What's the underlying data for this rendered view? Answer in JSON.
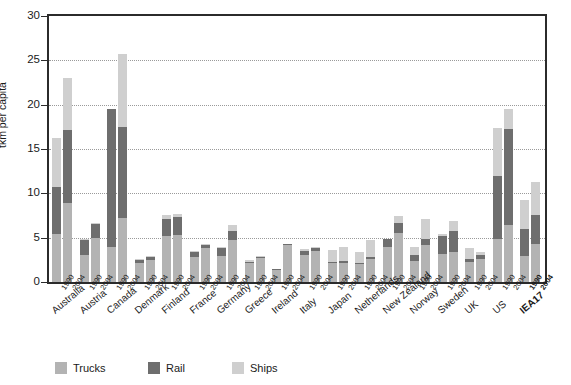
{
  "chart_data": {
    "type": "bar",
    "stacked": true,
    "title": "",
    "xlabel": "",
    "ylabel": "tkm per capita",
    "ylim": [
      0,
      30
    ],
    "ytick_step": 5,
    "yticks": [
      0,
      5,
      10,
      15,
      20,
      25,
      30
    ],
    "grid": "horizontal-dotted",
    "legend_position": "bottom",
    "series_order_bottom_to_top": [
      "Trucks",
      "Rail",
      "Ships"
    ],
    "legend": [
      {
        "name": "Trucks",
        "color": "#b3b3b3"
      },
      {
        "name": "Rail",
        "color": "#6e6e6e"
      },
      {
        "name": "Ships",
        "color": "#cfcfcf"
      }
    ],
    "categories": [
      "Australia",
      "Austria",
      "Canada",
      "Denmark",
      "Finland",
      "France",
      "Germany",
      "Greece",
      "Ireland",
      "Italy",
      "Japan",
      "Netherlands",
      "New Zealand",
      "Norway",
      "Sweden",
      "UK",
      "US",
      "IEA17"
    ],
    "years": [
      "1990",
      "2004"
    ],
    "highlight_category": "IEA17",
    "data": [
      {
        "country": "Australia",
        "year": "1990",
        "trucks": 5.4,
        "rail": 5.3,
        "ships": 5.6,
        "total": 16.3
      },
      {
        "country": "Australia",
        "year": "2004",
        "trucks": 8.9,
        "rail": 8.3,
        "ships": 5.8,
        "total": 23.0
      },
      {
        "country": "Austria",
        "year": "1990",
        "trucks": 3.1,
        "rail": 1.6,
        "ships": 0.1,
        "total": 4.8
      },
      {
        "country": "Austria",
        "year": "2004",
        "trucks": 5.0,
        "rail": 1.6,
        "ships": 0.1,
        "total": 6.7
      },
      {
        "country": "Canada",
        "year": "1990",
        "trucks": 3.9,
        "rail": 15.6,
        "ships": 0.0,
        "total": 19.5
      },
      {
        "country": "Canada",
        "year": "2004",
        "trucks": 7.2,
        "rail": 10.3,
        "ships": 8.2,
        "total": 25.7
      },
      {
        "country": "Denmark",
        "year": "1990",
        "trucks": 2.2,
        "rail": 0.3,
        "ships": 0.1,
        "total": 2.6
      },
      {
        "country": "Denmark",
        "year": "2004",
        "trucks": 2.5,
        "rail": 0.3,
        "ships": 0.1,
        "total": 2.9
      },
      {
        "country": "Finland",
        "year": "1990",
        "trucks": 5.2,
        "rail": 1.9,
        "ships": 0.5,
        "total": 7.6
      },
      {
        "country": "Finland",
        "year": "2004",
        "trucks": 5.3,
        "rail": 2.0,
        "ships": 0.4,
        "total": 7.7
      },
      {
        "country": "France",
        "year": "1990",
        "trucks": 2.8,
        "rail": 0.6,
        "ships": 0.1,
        "total": 3.5
      },
      {
        "country": "France",
        "year": "2004",
        "trucks": 3.8,
        "rail": 0.4,
        "ships": 0.1,
        "total": 4.3
      },
      {
        "country": "Germany",
        "year": "1990",
        "trucks": 2.9,
        "rail": 1.0,
        "ships": 0.1,
        "total": 4.0
      },
      {
        "country": "Germany",
        "year": "2004",
        "trucks": 4.7,
        "rail": 1.0,
        "ships": 0.7,
        "total": 6.4
      },
      {
        "country": "Greece",
        "year": "1990",
        "trucks": 2.1,
        "rail": 0.2,
        "ships": 0.2,
        "total": 2.5
      },
      {
        "country": "Greece",
        "year": "2004",
        "trucks": 2.7,
        "rail": 0.1,
        "ships": 0.1,
        "total": 2.9
      },
      {
        "country": "Ireland",
        "year": "1990",
        "trucks": 1.4,
        "rail": 0.1,
        "ships": 0.0,
        "total": 1.5
      },
      {
        "country": "Ireland",
        "year": "2004",
        "trucks": 4.2,
        "rail": 0.1,
        "ships": 0.0,
        "total": 4.3
      },
      {
        "country": "Italy",
        "year": "1990",
        "trucks": 3.1,
        "rail": 0.4,
        "ships": 0.2,
        "total": 3.7
      },
      {
        "country": "Italy",
        "year": "2004",
        "trucks": 3.5,
        "rail": 0.4,
        "ships": 0.1,
        "total": 4.0
      },
      {
        "country": "Japan",
        "year": "1990",
        "trucks": 2.1,
        "rail": 0.2,
        "ships": 1.3,
        "total": 3.6
      },
      {
        "country": "Japan",
        "year": "2004",
        "trucks": 2.2,
        "rail": 0.2,
        "ships": 1.5,
        "total": 3.9
      },
      {
        "country": "Netherlands",
        "year": "1990",
        "trucks": 2.0,
        "rail": 0.2,
        "ships": 1.2,
        "total": 3.4
      },
      {
        "country": "Netherlands",
        "year": "2004",
        "trucks": 2.6,
        "rail": 0.2,
        "ships": 1.9,
        "total": 4.7
      },
      {
        "country": "New Zealand",
        "year": "1990",
        "trucks": 3.9,
        "rail": 1.0,
        "ships": 0.0,
        "total": 4.9
      },
      {
        "country": "New Zealand",
        "year": "2004",
        "trucks": 5.5,
        "rail": 1.1,
        "ships": 0.9,
        "total": 7.5
      },
      {
        "country": "Norway",
        "year": "1990",
        "trucks": 2.4,
        "rail": 0.6,
        "ships": 1.0,
        "total": 4.0
      },
      {
        "country": "Norway",
        "year": "2004",
        "trucks": 4.2,
        "rail": 0.7,
        "ships": 2.2,
        "total": 7.1
      },
      {
        "country": "Sweden",
        "year": "1990",
        "trucks": 3.2,
        "rail": 2.0,
        "ships": 0.2,
        "total": 5.4
      },
      {
        "country": "Sweden",
        "year": "2004",
        "trucks": 3.4,
        "rail": 2.4,
        "ships": 1.1,
        "total": 6.9
      },
      {
        "country": "UK",
        "year": "1990",
        "trucks": 2.3,
        "rail": 0.3,
        "ships": 1.2,
        "total": 3.8
      },
      {
        "country": "UK",
        "year": "2004",
        "trucks": 2.6,
        "rail": 0.4,
        "ships": 0.4,
        "total": 3.4
      },
      {
        "country": "US",
        "year": "1990",
        "trucks": 4.8,
        "rail": 7.2,
        "ships": 5.4,
        "total": 17.4
      },
      {
        "country": "US",
        "year": "2004",
        "trucks": 6.4,
        "rail": 10.9,
        "ships": 2.2,
        "total": 19.5
      },
      {
        "country": "IEA17",
        "year": "1990",
        "trucks": 2.9,
        "rail": 3.1,
        "ships": 3.3,
        "total": 9.3
      },
      {
        "country": "IEA17",
        "year": "2004",
        "trucks": 4.3,
        "rail": 3.3,
        "ships": 3.7,
        "total": 11.3
      }
    ]
  }
}
